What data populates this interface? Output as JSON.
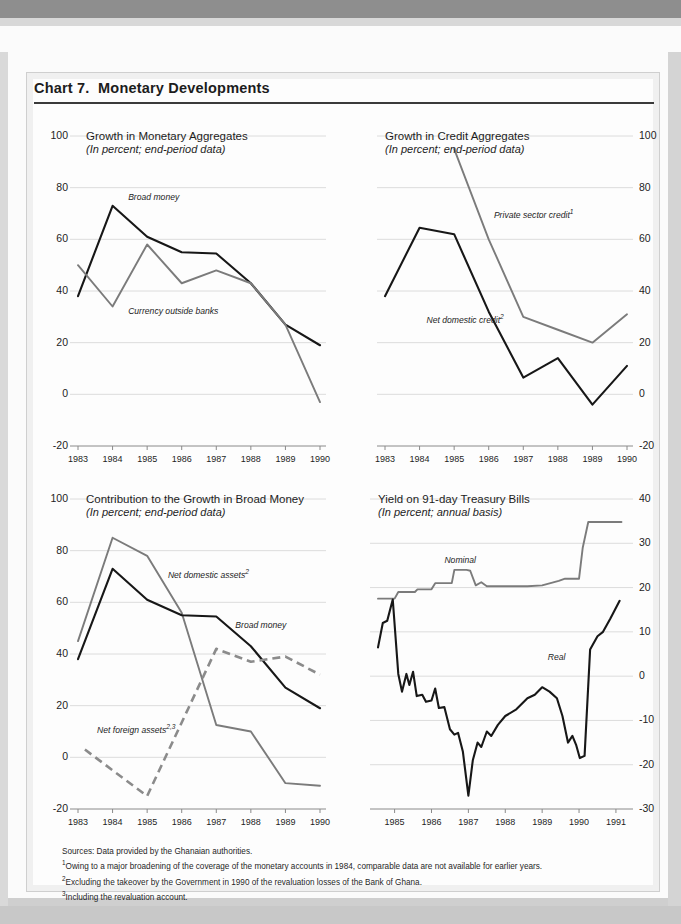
{
  "document": {
    "chart_number": "Chart 7.",
    "title": "Chart 7.  Monetary Developments"
  },
  "footnotes": {
    "source": "Sources: Data provided by the Ghanaian authorities.",
    "note1_marker": "1",
    "note1": "Owing to a major broadening of the coverage of the monetary accounts in 1984, comparable data are not available for earlier years.",
    "note2_marker": "2",
    "note2": "Excluding the takeover by the Government in 1990 of the revaluation losses of the Bank of Ghana.",
    "note3_marker": "3",
    "note3": "Including the revaluation account."
  },
  "chart_data": [
    {
      "id": "monetary-aggregates",
      "type": "line",
      "title": "Growth in Monetary Aggregates",
      "subtitle": "(In percent; end-period data)",
      "xlabel": "",
      "ylabel": "",
      "ylim": [
        -20,
        100
      ],
      "yticks": [
        100,
        80,
        60,
        40,
        20,
        0,
        -20
      ],
      "grid": true,
      "axis_side": "left",
      "categories": [
        "1983",
        "1984",
        "1985",
        "1986",
        "1987",
        "1988",
        "1989",
        "1990"
      ],
      "x": [
        1983,
        1984,
        1985,
        1986,
        1987,
        1988,
        1989,
        1990
      ],
      "series": [
        {
          "name": "Broad money",
          "style": "solid-black",
          "x": [
            1983,
            1984,
            1985,
            1986,
            1987,
            1988,
            1989,
            1990
          ],
          "values": [
            38,
            73,
            61,
            55,
            54.5,
            43,
            27,
            19
          ],
          "label_pos": {
            "x": 1984.45,
            "y": 76
          }
        },
        {
          "name": "Currency outside banks",
          "style": "solid-gray",
          "x": [
            1983,
            1984,
            1985,
            1986,
            1987,
            1988,
            1989,
            1990
          ],
          "values": [
            50,
            34,
            58,
            43,
            48,
            43,
            27,
            -3
          ],
          "label_pos": {
            "x": 1984.45,
            "y": 32
          }
        }
      ]
    },
    {
      "id": "credit-aggregates",
      "type": "line",
      "title": "Growth in Credit  Aggregates",
      "subtitle": "(In percent; end-period data)",
      "xlabel": "",
      "ylabel": "",
      "ylim": [
        -20,
        100
      ],
      "yticks": [
        100,
        80,
        60,
        40,
        20,
        0,
        -20
      ],
      "grid": true,
      "axis_side": "right",
      "categories": [
        "1983",
        "1984",
        "1985",
        "1986",
        "1987",
        "1988",
        "1989",
        "1990"
      ],
      "x": [
        1983,
        1984,
        1985,
        1986,
        1987,
        1988,
        1989,
        1990
      ],
      "series": [
        {
          "name": "Private sector credit",
          "footnote": "1",
          "style": "solid-gray",
          "x": [
            1985,
            1986,
            1987,
            1988,
            1989,
            1990
          ],
          "values": [
            95,
            60,
            30,
            25,
            20,
            31
          ],
          "label_pos": {
            "x": 1986.15,
            "y": 70
          }
        },
        {
          "name": "Net domestic credit",
          "footnote": "2",
          "style": "solid-black",
          "x": [
            1983,
            1984,
            1985,
            1986,
            1987,
            1988,
            1989,
            1990
          ],
          "values": [
            38,
            64.5,
            62,
            32,
            6.5,
            14,
            -4,
            11
          ],
          "label_pos": {
            "x": 1984.2,
            "y": 29
          }
        }
      ]
    },
    {
      "id": "contribution-broad-money",
      "type": "line",
      "title": "Contribution to the Growth in Broad Money",
      "subtitle": "(In percent; end-period data)",
      "xlabel": "",
      "ylabel": "",
      "ylim": [
        -20,
        100
      ],
      "yticks": [
        100,
        80,
        60,
        40,
        20,
        0,
        -20
      ],
      "grid": true,
      "axis_side": "left",
      "categories": [
        "1983",
        "1984",
        "1985",
        "1986",
        "1987",
        "1988",
        "1989",
        "1990"
      ],
      "x": [
        1983,
        1984,
        1985,
        1986,
        1987,
        1988,
        1989,
        1990
      ],
      "series": [
        {
          "name": "Net domestic assets",
          "footnote": "2",
          "style": "solid-gray",
          "x": [
            1983,
            1984,
            1985,
            1986,
            1987,
            1988,
            1989,
            1990
          ],
          "values": [
            45,
            85,
            78,
            56,
            12.5,
            10,
            -10,
            -11
          ],
          "label_pos": {
            "x": 1985.6,
            "y": 71
          }
        },
        {
          "name": "Broad money",
          "style": "solid-black",
          "x": [
            1983,
            1984,
            1985,
            1986,
            1987,
            1988,
            1989,
            1990
          ],
          "values": [
            38,
            73,
            61,
            55,
            54.5,
            43,
            27,
            19
          ],
          "label_pos": {
            "x": 1987.55,
            "y": 51
          }
        },
        {
          "name": "Net foreign assets",
          "footnote": "2,3",
          "style": "dashed-gray",
          "x": [
            1983.2,
            1985,
            1987,
            1988,
            1989,
            1990
          ],
          "values": [
            3,
            -15,
            42,
            37,
            39,
            32
          ],
          "label_pos": {
            "x": 1983.55,
            "y": 11
          }
        }
      ]
    },
    {
      "id": "treasury-bill-yield",
      "type": "line",
      "title": "Yield on 91-day Treasury Bills",
      "subtitle": "(In percent; annual basis)",
      "xlabel": "",
      "ylabel": "",
      "ylim": [
        -30,
        40
      ],
      "yticks": [
        40,
        30,
        20,
        10,
        0,
        -10,
        -20,
        -30
      ],
      "grid": true,
      "axis_side": "right",
      "categories": [
        "1985",
        "1986",
        "1987",
        "1988",
        "1989",
        "1990",
        "1991"
      ],
      "x": [
        1985,
        1986,
        1987,
        1988,
        1989,
        1990,
        1991
      ],
      "series": [
        {
          "name": "Nominal",
          "style": "solid-gray",
          "label_pos": {
            "x": 1986.35,
            "y": 26
          },
          "points": [
            [
              1984.55,
              17.5
            ],
            [
              1985.0,
              17.5
            ],
            [
              1985.1,
              19
            ],
            [
              1985.55,
              19
            ],
            [
              1985.62,
              19.6
            ],
            [
              1986.0,
              19.6
            ],
            [
              1986.1,
              21
            ],
            [
              1986.55,
              21
            ],
            [
              1986.62,
              24
            ],
            [
              1986.95,
              24
            ],
            [
              1987.05,
              23.8
            ],
            [
              1987.2,
              20.5
            ],
            [
              1987.35,
              21.2
            ],
            [
              1987.5,
              20.3
            ],
            [
              1988.6,
              20.3
            ],
            [
              1989.0,
              20.5
            ],
            [
              1989.45,
              21.5
            ],
            [
              1989.62,
              22
            ],
            [
              1990.0,
              22
            ],
            [
              1990.1,
              29
            ],
            [
              1990.25,
              34.8
            ],
            [
              1991.15,
              34.8
            ]
          ]
        },
        {
          "name": "Real",
          "style": "solid-black",
          "label_pos": {
            "x": 1989.15,
            "y": 4
          },
          "points": [
            [
              1984.55,
              6.5
            ],
            [
              1984.68,
              12
            ],
            [
              1984.8,
              12.5
            ],
            [
              1984.95,
              17.3
            ],
            [
              1985.1,
              0.5
            ],
            [
              1985.2,
              -3.5
            ],
            [
              1985.32,
              0.5
            ],
            [
              1985.4,
              -2
            ],
            [
              1985.5,
              1
            ],
            [
              1985.6,
              -4.5
            ],
            [
              1985.75,
              -4.2
            ],
            [
              1985.85,
              -5.8
            ],
            [
              1986.0,
              -5.5
            ],
            [
              1986.1,
              -2.8
            ],
            [
              1986.2,
              -7.2
            ],
            [
              1986.35,
              -7
            ],
            [
              1986.5,
              -12
            ],
            [
              1986.62,
              -13.2
            ],
            [
              1986.72,
              -12.8
            ],
            [
              1986.85,
              -17
            ],
            [
              1987.0,
              -27
            ],
            [
              1987.12,
              -19
            ],
            [
              1987.25,
              -15
            ],
            [
              1987.35,
              -16
            ],
            [
              1987.5,
              -12.5
            ],
            [
              1987.62,
              -13.5
            ],
            [
              1987.8,
              -11
            ],
            [
              1988.0,
              -9
            ],
            [
              1988.3,
              -7.5
            ],
            [
              1988.6,
              -5
            ],
            [
              1988.8,
              -4.2
            ],
            [
              1989.0,
              -2.5
            ],
            [
              1989.2,
              -3.5
            ],
            [
              1989.4,
              -5
            ],
            [
              1989.55,
              -9
            ],
            [
              1989.7,
              -15
            ],
            [
              1989.82,
              -13.5
            ],
            [
              1989.92,
              -15.5
            ],
            [
              1990.02,
              -18.5
            ],
            [
              1990.15,
              -18
            ],
            [
              1990.3,
              6
            ],
            [
              1990.5,
              9
            ],
            [
              1990.65,
              10
            ],
            [
              1990.85,
              13
            ],
            [
              1991.1,
              17
            ]
          ]
        }
      ]
    }
  ]
}
